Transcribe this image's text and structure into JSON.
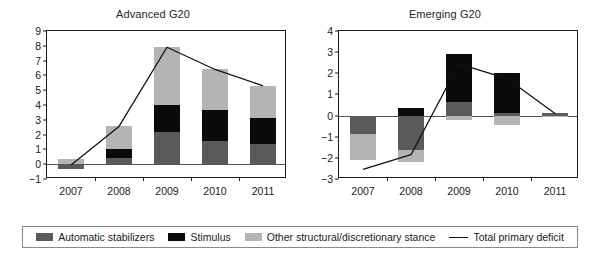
{
  "legend": {
    "items": [
      {
        "label": "Automatic stabilizers",
        "type": "swatch",
        "color": "#5a5a5a",
        "key": "automatic_stabilizers"
      },
      {
        "label": "Stimulus",
        "type": "swatch",
        "color": "#0a0a0a",
        "key": "stimulus"
      },
      {
        "label": "Other structural/discretionary stance",
        "type": "swatch",
        "color": "#b4b4b4",
        "key": "other_structural"
      },
      {
        "label": "Total primary deficit",
        "type": "line",
        "color": "#111111",
        "key": "total_primary_deficit"
      }
    ]
  },
  "chart_data": [
    {
      "type": "bar",
      "subtype": "stacked-bar-with-line",
      "title": "Advanced G20",
      "xlabel": "",
      "ylabel": "",
      "categories": [
        "2007",
        "2008",
        "2009",
        "2010",
        "2011"
      ],
      "ylim": [
        -1,
        9
      ],
      "yticks": [
        -1,
        0,
        1,
        2,
        3,
        4,
        5,
        6,
        7,
        8,
        9
      ],
      "grid": false,
      "legend_position": "bottom-shared",
      "series": [
        {
          "name": "Automatic stabilizers",
          "color": "#5a5a5a",
          "values": [
            -0.3,
            0.4,
            2.2,
            1.6,
            1.35
          ]
        },
        {
          "name": "Stimulus",
          "color": "#0a0a0a",
          "values": [
            0.0,
            0.6,
            1.8,
            2.05,
            1.75
          ]
        },
        {
          "name": "Other structural/discretionary stance",
          "color": "#b4b4b4",
          "values": [
            0.35,
            1.55,
            3.9,
            2.75,
            2.2
          ]
        },
        {
          "name": "Total primary deficit",
          "color": "#111111",
          "type": "line",
          "values": [
            -0.05,
            2.55,
            7.9,
            6.4,
            5.3
          ]
        }
      ]
    },
    {
      "type": "bar",
      "subtype": "stacked-bar-with-line",
      "title": "Emerging G20",
      "xlabel": "",
      "ylabel": "",
      "categories": [
        "2007",
        "2008",
        "2009",
        "2010",
        "2011"
      ],
      "ylim": [
        -3,
        4
      ],
      "yticks": [
        -3,
        -2,
        -1,
        0,
        1,
        2,
        3,
        4
      ],
      "grid": false,
      "legend_position": "bottom-shared",
      "series": [
        {
          "name": "Automatic stabilizers",
          "color": "#5a5a5a",
          "values": [
            -0.85,
            -1.65,
            0.65,
            0.12,
            0.12
          ]
        },
        {
          "name": "Stimulus",
          "color": "#0a0a0a",
          "values": [
            0.0,
            0.35,
            2.25,
            1.88,
            0.0
          ]
        },
        {
          "name": "Other structural/discretionary stance",
          "color": "#b4b4b4",
          "values": [
            -1.25,
            -0.55,
            -0.2,
            -0.45,
            -0.05
          ]
        },
        {
          "name": "Total primary deficit",
          "color": "#111111",
          "type": "line",
          "values": [
            -2.55,
            -1.85,
            2.45,
            1.75,
            0.1
          ]
        }
      ]
    }
  ]
}
